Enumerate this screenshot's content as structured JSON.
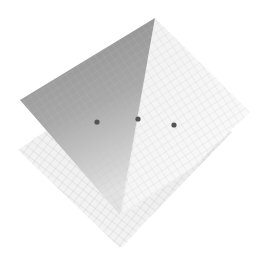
{
  "diagram": {
    "title": "",
    "colors": {
      "background": "#ffffff",
      "dark_plane_top": "#8a8a8a",
      "dark_plane_bottom": "#d4d4d4",
      "light_plane": "#f6f6f6",
      "lower_plane": "#efefef",
      "grid_line": "#c4c4c4",
      "point": "#5a5a5a"
    },
    "points": [
      {
        "x": 97,
        "y": 122
      },
      {
        "x": 138,
        "y": 119
      },
      {
        "x": 174,
        "y": 125
      }
    ]
  }
}
